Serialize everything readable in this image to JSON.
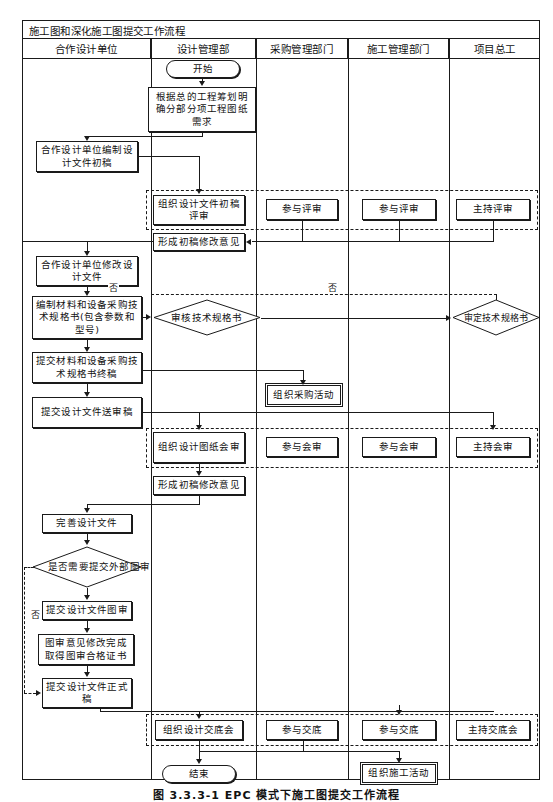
{
  "title": "施工图和深化施工图提交工作流程",
  "columns": [
    {
      "label": "合作设计单位"
    },
    {
      "label": "设计管理部"
    },
    {
      "label": "采购管理部门"
    },
    {
      "label": "施工管理部门"
    },
    {
      "label": "项目总工"
    }
  ],
  "nodes": {
    "start": "开始",
    "plan_requirement": "根据总的工程筹划明确分部分项工程图纸需求",
    "partner_draft": "合作设计单位编制设计文件初稿",
    "organize_draft_review": "组织设计文件初稿评审",
    "join_review_purchase": "参与评审",
    "join_review_construction": "参与评审",
    "host_review": "主持评审",
    "draft_revision_opinion": "形成初稿修改意见",
    "partner_revise": "合作设计单位修改设计文件",
    "spec_compile": "编制材料和设备采购技术规格书(包含参数和型号)",
    "spec_check": "审核技术规格书",
    "spec_approve": "审定技术规格书",
    "submit_spec_final": "提交材料和设备采购技术规格书终稿",
    "submit_design_review": "提交设计文件送审稿",
    "organize_purchase": "组织采购活动",
    "organize_drawing_review": "组织设计图纸会审",
    "join_joint_review_purchase": "参与会审",
    "join_joint_review_construction": "参与会审",
    "host_joint_review": "主持会审",
    "draft_revision_opinion_2": "形成初稿修改意见",
    "improve_design": "完善设计文件",
    "need_external_review": "是否需要提交外部图审",
    "submit_external_review": "提交设计文件图审",
    "obtain_certificate": "图审意见修改完成取得图审合格证书",
    "submit_final": "提交设计文件正式稿",
    "organize_handover": "组织设计交底会",
    "join_handover_purchase": "参与交底",
    "join_handover_construction": "参与交底",
    "host_handover": "主持交底会",
    "end": "结束",
    "organize_construction": "组织施工活动"
  },
  "edge_labels": {
    "no_1": "否",
    "no_2": "否",
    "no_3": "否"
  },
  "caption": "图 3.3.3-1  EPC 模式下施工图提交工作流程"
}
